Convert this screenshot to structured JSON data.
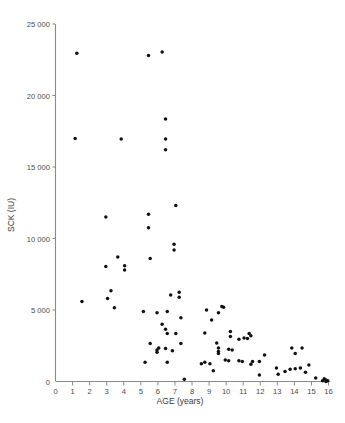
{
  "figure": {
    "background_color": "#ffffff",
    "point_color": "#111111",
    "axis_color": "#8a8a8a",
    "text_color": "#4a4a4a"
  },
  "axes": {
    "x_label": "AGE (years)",
    "y_label": "SCK (IU)",
    "x_ticks": [
      "0",
      "1",
      "2",
      "3",
      "4",
      "5",
      "6",
      "7",
      "8",
      "9",
      "10",
      "11",
      "12",
      "13",
      "14",
      "15",
      "16"
    ],
    "y_ticks": [
      "0",
      "5 000",
      "10 000",
      "15 000",
      "20 000",
      "25 000"
    ]
  },
  "chart_data": {
    "type": "scatter",
    "title": "",
    "xlabel": "AGE (years)",
    "ylabel": "SCK (IU)",
    "xlim": [
      0,
      16
    ],
    "ylim": [
      0,
      25000
    ],
    "xticks": [
      0,
      1,
      2,
      3,
      4,
      5,
      6,
      7,
      8,
      9,
      10,
      11,
      12,
      13,
      14,
      15,
      16
    ],
    "yticks": [
      0,
      5000,
      10000,
      15000,
      20000,
      25000
    ],
    "ytick_labels": [
      "0",
      "5 000",
      "10 000",
      "15 000",
      "20 000",
      "25 000"
    ],
    "grid": false,
    "legend": false,
    "series": [
      {
        "name": "patients",
        "marker": "filled-circle",
        "color": "#111111",
        "points": [
          [
            1.25,
            22950
          ],
          [
            5.45,
            22800
          ],
          [
            6.25,
            23050
          ],
          [
            1.15,
            17000
          ],
          [
            3.85,
            16950
          ],
          [
            6.45,
            18350
          ],
          [
            6.45,
            16950
          ],
          [
            6.45,
            16200
          ],
          [
            7.05,
            12300
          ],
          [
            5.45,
            11700
          ],
          [
            2.95,
            11500
          ],
          [
            5.45,
            10750
          ],
          [
            6.95,
            9600
          ],
          [
            6.95,
            9200
          ],
          [
            5.55,
            8600
          ],
          [
            3.65,
            8700
          ],
          [
            2.95,
            8050
          ],
          [
            4.05,
            8100
          ],
          [
            4.05,
            7800
          ],
          [
            7.25,
            6250
          ],
          [
            6.75,
            6050
          ],
          [
            7.25,
            5900
          ],
          [
            3.25,
            6350
          ],
          [
            3.05,
            5800
          ],
          [
            1.55,
            5600
          ],
          [
            3.45,
            5150
          ],
          [
            5.15,
            4900
          ],
          [
            5.95,
            4800
          ],
          [
            6.55,
            4900
          ],
          [
            7.35,
            4450
          ],
          [
            8.85,
            5000
          ],
          [
            9.75,
            5250
          ],
          [
            9.85,
            5200
          ],
          [
            9.55,
            4800
          ],
          [
            9.15,
            4300
          ],
          [
            6.25,
            4000
          ],
          [
            6.45,
            3650
          ],
          [
            6.55,
            3350
          ],
          [
            7.05,
            3350
          ],
          [
            10.25,
            3500
          ],
          [
            10.25,
            3150
          ],
          [
            11.35,
            3350
          ],
          [
            11.45,
            3200
          ],
          [
            10.75,
            2950
          ],
          [
            11.05,
            3050
          ],
          [
            11.25,
            3000
          ],
          [
            8.75,
            3400
          ],
          [
            9.45,
            2700
          ],
          [
            9.55,
            2350
          ],
          [
            5.55,
            2650
          ],
          [
            5.95,
            2200
          ],
          [
            5.95,
            2050
          ],
          [
            6.05,
            2350
          ],
          [
            6.45,
            2300
          ],
          [
            6.85,
            2150
          ],
          [
            7.35,
            2650
          ],
          [
            10.15,
            2250
          ],
          [
            10.35,
            2200
          ],
          [
            9.55,
            2100
          ],
          [
            9.55,
            1950
          ],
          [
            13.85,
            2350
          ],
          [
            14.45,
            2350
          ],
          [
            14.05,
            1950
          ],
          [
            12.25,
            1850
          ],
          [
            11.95,
            1400
          ],
          [
            11.55,
            1400
          ],
          [
            11.45,
            1200
          ],
          [
            10.75,
            1450
          ],
          [
            10.95,
            1400
          ],
          [
            10.15,
            1450
          ],
          [
            9.95,
            1500
          ],
          [
            8.75,
            1350
          ],
          [
            8.55,
            1250
          ],
          [
            9.05,
            1250
          ],
          [
            9.25,
            750
          ],
          [
            5.25,
            1350
          ],
          [
            6.55,
            1350
          ],
          [
            12.95,
            950
          ],
          [
            13.45,
            700
          ],
          [
            13.75,
            850
          ],
          [
            14.05,
            900
          ],
          [
            14.35,
            950
          ],
          [
            13.05,
            500
          ],
          [
            11.95,
            450
          ],
          [
            14.85,
            1150
          ],
          [
            14.65,
            650
          ],
          [
            7.55,
            150
          ],
          [
            15.25,
            250
          ],
          [
            15.75,
            200
          ],
          [
            15.85,
            100
          ],
          [
            15.95,
            50
          ],
          [
            15.85,
            0
          ],
          [
            15.65,
            50
          ]
        ]
      }
    ]
  }
}
